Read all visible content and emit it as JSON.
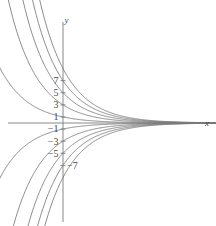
{
  "chart_data": {
    "type": "line",
    "title": "",
    "subtitle": "",
    "xlabel": "x",
    "ylabel": "y",
    "xlim": [
      -5.4,
      12.8
    ],
    "ylim": [
      -17.2,
      17.2
    ],
    "grid": false,
    "legend": null,
    "x_axis_ticks": [],
    "y_axis_ticks": [
      {
        "value": 7,
        "label": "7"
      },
      {
        "value": 5,
        "label": "5"
      },
      {
        "value": 3,
        "label": "3"
      },
      {
        "value": 1,
        "label": "1"
      },
      {
        "value": -1,
        "label": "−1"
      },
      {
        "value": -3,
        "label": "−3"
      },
      {
        "value": -5,
        "label": "−5"
      },
      {
        "value": -7,
        "label": "−7"
      }
    ],
    "series": [
      {
        "name": "C = 9",
        "C": 9,
        "k": 0.42
      },
      {
        "name": "C = 7",
        "C": 7,
        "k": 0.42
      },
      {
        "name": "C = 5",
        "C": 5,
        "k": 0.42
      },
      {
        "name": "C = 3",
        "C": 3,
        "k": 0.42
      },
      {
        "name": "C = 1",
        "C": 1,
        "k": 0.42
      },
      {
        "name": "C = -1",
        "C": -1,
        "k": 0.42
      },
      {
        "name": "C = -3",
        "C": -3,
        "k": 0.42
      },
      {
        "name": "C = -5",
        "C": -5,
        "k": 0.42
      },
      {
        "name": "C = -7",
        "C": -7,
        "k": 0.42
      },
      {
        "name": "C = -9",
        "C": -9,
        "k": 0.42
      }
    ]
  },
  "style": {
    "curve_color": "#7b7b7b",
    "axis_color": "#7b7b7b",
    "label_color": "#4a4a4a",
    "background": "#ffffff",
    "curve_width": 0.9,
    "axis_width": 0.9
  },
  "geometry": {
    "origin_x": 63,
    "origin_y": 123,
    "unit_px_y": 6.05,
    "unit_px_x": 12.0,
    "tick_half": 2.5,
    "y_axis_top": 22,
    "y_axis_bottom": 222,
    "x_axis_left": 8,
    "x_axis_right": 203
  },
  "labels": {
    "x_axis_name": "x",
    "y_axis_name": "y"
  }
}
